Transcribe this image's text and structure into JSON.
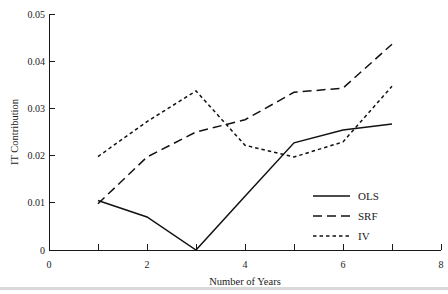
{
  "chart_data": {
    "type": "line",
    "title": "",
    "xlabel": "Number of Years",
    "ylabel": "IT Contribution",
    "xlim": [
      0,
      8
    ],
    "ylim": [
      0,
      0.05
    ],
    "xticks": [
      0,
      2,
      4,
      6,
      8
    ],
    "xtick_labels": [
      "0",
      "2",
      "4",
      "6",
      "8"
    ],
    "xminor_ticks": [
      1,
      3,
      5,
      7
    ],
    "yticks": [
      0,
      0.01,
      0.02,
      0.03,
      0.04,
      0.05
    ],
    "ytick_labels": [
      "0",
      "0.01",
      "0.02",
      "0.03",
      "0.04",
      "0.05"
    ],
    "grid": false,
    "legend_position": "lower right",
    "x": [
      1,
      2,
      3,
      4,
      5,
      6,
      7
    ],
    "series": [
      {
        "name": "OLS",
        "style": "solid",
        "values": [
          0.0105,
          0.007,
          0.0,
          0.0114,
          0.0227,
          0.0254,
          0.0267
        ]
      },
      {
        "name": "SRF",
        "style": "long-dash",
        "values": [
          0.0098,
          0.0197,
          0.025,
          0.0276,
          0.0334,
          0.0343,
          0.0436
        ]
      },
      {
        "name": "IV",
        "style": "short-dash",
        "values": [
          0.0198,
          0.0272,
          0.0337,
          0.0222,
          0.0197,
          0.0229,
          0.0347
        ]
      }
    ]
  },
  "axes": {
    "x_title": "Number of Years",
    "y_title": "IT Contribution",
    "x_tick_labels": [
      "0",
      "2",
      "4",
      "6",
      "8"
    ],
    "y_tick_labels": [
      "0",
      "0.01",
      "0.02",
      "0.03",
      "0.04",
      "0.05"
    ]
  },
  "legend": {
    "entries": [
      {
        "label": "OLS",
        "style": "solid"
      },
      {
        "label": "SRF",
        "style": "long-dash"
      },
      {
        "label": "IV",
        "style": "short-dash"
      }
    ]
  },
  "colors": {
    "line": "#121212",
    "axis": "#1a1a1a",
    "background": "#ffffff",
    "rule": "#d9d9d9"
  }
}
